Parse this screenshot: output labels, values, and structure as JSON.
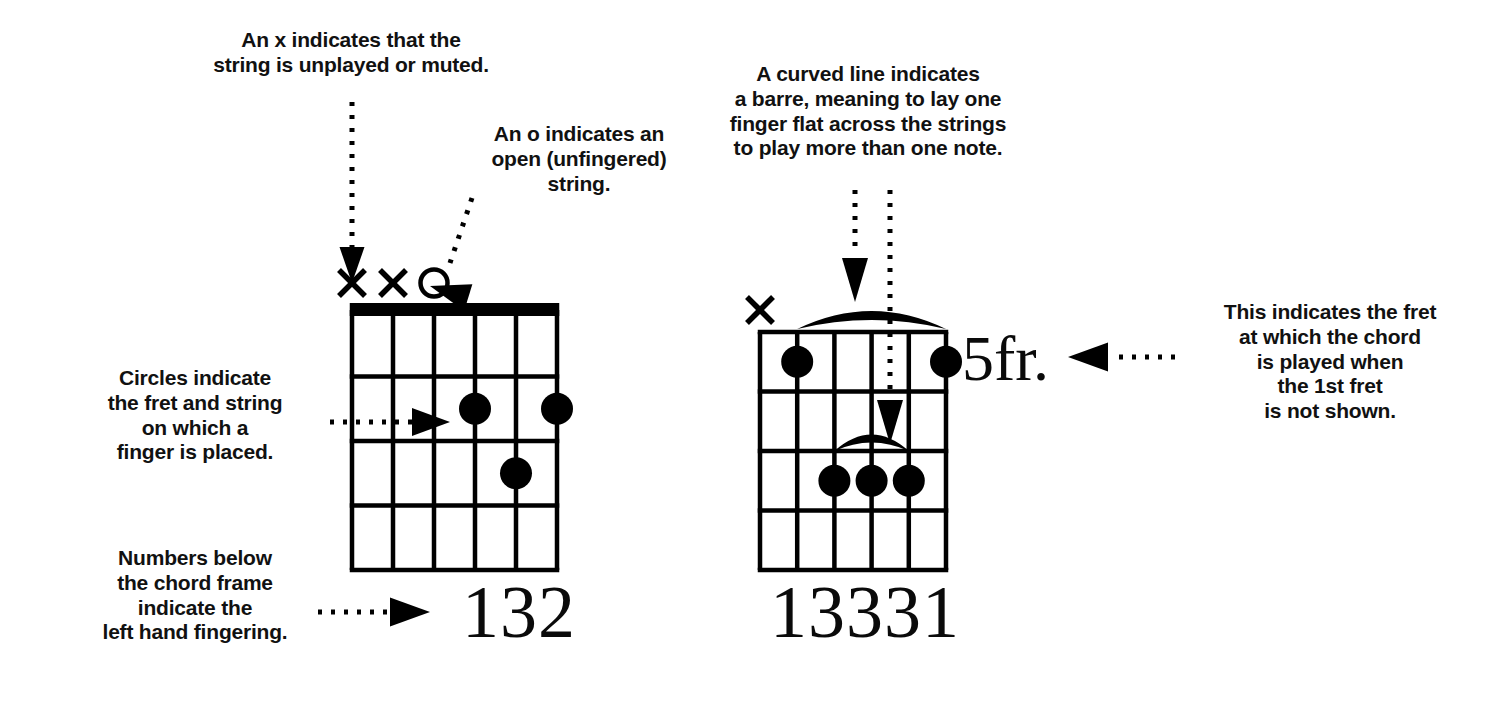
{
  "page": {
    "background_color": "#ffffff",
    "ink_color": "#000000",
    "width": 1498,
    "height": 702
  },
  "callouts": {
    "muted_string": {
      "text": "An x indicates that the\nstring is unplayed or muted.",
      "x": 186,
      "y": 28,
      "width": 330,
      "font_size": 21
    },
    "open_string": {
      "text": "An o indicates an\nopen (unfingered)\nstring.",
      "x": 466,
      "y": 122,
      "width": 226,
      "font_size": 21
    },
    "barre": {
      "text": "A curved line indicates\na barre, meaning to lay one\nfinger flat across the strings\nto play more than one note.",
      "x": 708,
      "y": 62,
      "width": 320,
      "font_size": 21
    },
    "circles": {
      "text": "Circles indicate\nthe fret and string\non which a\nfinger is placed.",
      "x": 62,
      "y": 366,
      "width": 266,
      "font_size": 21
    },
    "numbers": {
      "text": "Numbers below\nthe chord frame\nindicate the\nleft hand fingering.",
      "x": 62,
      "y": 546,
      "width": 266,
      "font_size": 21
    },
    "fret_indicator": {
      "text": "This indicates the fret\nat which the chord\nis played when\nthe 1st fret\nis not shown.",
      "x": 1192,
      "y": 300,
      "width": 276,
      "font_size": 21
    }
  },
  "diagrams": [
    {
      "name": "chord-diagram-open",
      "strings": 6,
      "frets": 4,
      "has_nut": true,
      "grid": {
        "x": 352,
        "y": 312,
        "width": 205,
        "height": 258
      },
      "string_markers": [
        {
          "string": 1,
          "symbol": "x"
        },
        {
          "string": 2,
          "symbol": "x"
        },
        {
          "string": 3,
          "symbol": "o"
        }
      ],
      "dots": [
        {
          "string": 4,
          "fret": 2
        },
        {
          "string": 6,
          "fret": 2
        },
        {
          "string": 5,
          "fret": 3
        }
      ],
      "barres": [],
      "fingering": "132",
      "fingering_x": 462,
      "fingering_y": 570,
      "fingering_size": 74,
      "fret_label": ""
    },
    {
      "name": "chord-diagram-barre",
      "strings": 6,
      "frets": 4,
      "has_nut": false,
      "grid": {
        "x": 760,
        "y": 332,
        "width": 186,
        "height": 238
      },
      "string_markers": [
        {
          "string": 1,
          "symbol": "x"
        }
      ],
      "dots": [
        {
          "string": 2,
          "fret": 1
        },
        {
          "string": 6,
          "fret": 1
        },
        {
          "string": 3,
          "fret": 3
        },
        {
          "string": 4,
          "fret": 3
        },
        {
          "string": 5,
          "fret": 3
        }
      ],
      "barres": [
        {
          "position": "above-nut",
          "from_string": 2,
          "to_string": 6,
          "fret": 0
        },
        {
          "position": "in-fret",
          "from_string": 3,
          "to_string": 5,
          "fret": 2
        }
      ],
      "fingering": "13331",
      "fingering_x": 770,
      "fingering_y": 570,
      "fingering_size": 74,
      "fret_label": "5fr.",
      "fret_label_x": 962,
      "fret_label_y": 322,
      "fret_label_size": 64
    }
  ],
  "connectors": [
    {
      "name": "arrow-to-x-marker",
      "style": "dotted-vertical",
      "target": "x-marker"
    },
    {
      "name": "arrow-to-o-marker",
      "style": "dotted-diagonal",
      "target": "o-marker"
    },
    {
      "name": "arrow-to-outer-barre",
      "style": "dotted-vertical",
      "target": "barre-above-nut"
    },
    {
      "name": "arrow-to-inner-barre",
      "style": "dotted-vertical",
      "target": "barre-in-fret"
    },
    {
      "name": "arrow-to-dot",
      "style": "dotted-horizontal",
      "target": "finger-dot"
    },
    {
      "name": "arrow-to-fingering",
      "style": "dotted-horizontal",
      "target": "fingering-numbers"
    },
    {
      "name": "arrow-to-fret-label",
      "style": "dotted-horizontal",
      "target": "fret-label"
    }
  ]
}
